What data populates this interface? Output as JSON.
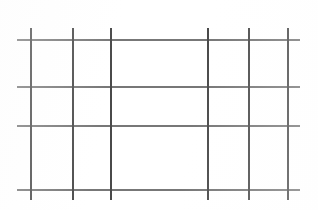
{
  "image": {
    "title": "Wire mesh grid",
    "width": 318,
    "height": 210,
    "background_color": "#ffffff"
  },
  "grid": {
    "vertical_line_color": "#4a4a4a",
    "horizontal_line_color": "#6b6b6b",
    "vertical_line_width": 2,
    "horizontal_line_width": 2,
    "vertical_count": 6,
    "horizontal_count": 4,
    "vertical_lines": [
      {
        "label": "v1",
        "x": 30,
        "y_start": 28,
        "y_end": 200
      },
      {
        "label": "v2",
        "x": 72,
        "y_start": 28,
        "y_end": 200
      },
      {
        "label": "v3",
        "x": 110,
        "y_start": 28,
        "y_end": 200
      },
      {
        "label": "v4",
        "x": 207,
        "y_start": 28,
        "y_end": 200
      },
      {
        "label": "v5",
        "x": 248,
        "y_start": 28,
        "y_end": 200
      },
      {
        "label": "v6",
        "x": 287,
        "y_start": 28,
        "y_end": 200
      }
    ],
    "horizontal_lines": [
      {
        "label": "h1",
        "y": 39,
        "x_start": 17,
        "x_end": 300
      },
      {
        "label": "h2",
        "y": 86,
        "x_start": 17,
        "x_end": 300
      },
      {
        "label": "h3",
        "y": 125,
        "x_start": 17,
        "x_end": 300
      },
      {
        "label": "h4",
        "y": 189,
        "x_start": 17,
        "x_end": 300
      }
    ]
  }
}
